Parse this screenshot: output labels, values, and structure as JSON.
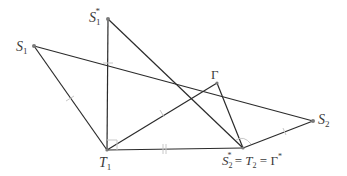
{
  "diagram": {
    "colors": {
      "line": "#2b2b2b",
      "tick": "#c8c8c8",
      "point": "#7a7a7a",
      "label": "#3a3a3a"
    },
    "points": {
      "S1_star": {
        "x": 108,
        "y": 19,
        "label": "S",
        "sub": "1",
        "sup": "*"
      },
      "S1": {
        "x": 34,
        "y": 46,
        "label": "S",
        "sub": "1",
        "sup": ""
      },
      "Gamma": {
        "x": 217,
        "y": 83,
        "label": "Γ",
        "sub": "",
        "sup": ""
      },
      "S2": {
        "x": 313,
        "y": 121,
        "label": "S",
        "sub": "2",
        "sup": ""
      },
      "T1": {
        "x": 107,
        "y": 150,
        "label": "T",
        "sub": "1",
        "sup": ""
      },
      "T2": {
        "x": 243,
        "y": 148,
        "label": "S",
        "sub": "2",
        "sup": "*"
      }
    },
    "labels": {
      "S1_star": {
        "main": "S",
        "sub": "1",
        "sup": "*"
      },
      "S1": {
        "main": "S",
        "sub": "1"
      },
      "Gamma": {
        "main": "Γ"
      },
      "S2": {
        "main": "S",
        "sub": "2"
      },
      "T1": {
        "main": "T",
        "sub": "1"
      },
      "T2_combined": {
        "part1_main": "S",
        "part1_sub": "2",
        "part1_sup": "*",
        "eq1": " = ",
        "part2_main": "T",
        "part2_sub": "2",
        "eq2": " = ",
        "part3_main": "Γ",
        "part3_sup": "*"
      }
    },
    "segments": [
      [
        "S1",
        "T1"
      ],
      [
        "S1",
        "S2"
      ],
      [
        "S1_star",
        "T1"
      ],
      [
        "S1_star",
        "T2"
      ],
      [
        "T1",
        "Gamma"
      ],
      [
        "Gamma",
        "T2"
      ],
      [
        "T1",
        "T2"
      ],
      [
        "T2",
        "S2"
      ]
    ],
    "markers": {
      "right_angle_at": "T1",
      "arc_at": "T2",
      "single_ticks_on": [
        [
          "S1_star",
          "T1"
        ],
        [
          "S1",
          "T1"
        ],
        [
          "T1",
          "Gamma"
        ],
        [
          "T2",
          "S2"
        ]
      ],
      "double_tick_on": [
        "T1",
        "T2"
      ]
    }
  }
}
